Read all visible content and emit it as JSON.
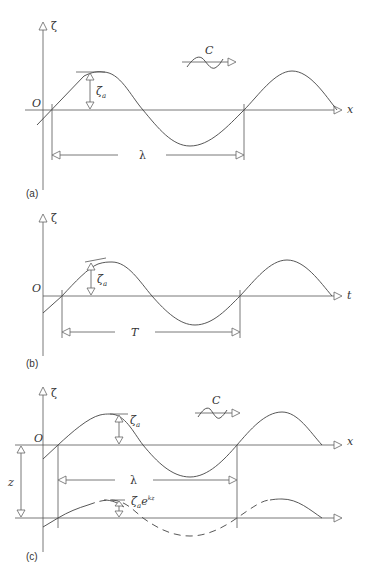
{
  "figure": {
    "panel_a": {
      "tag": "(a)",
      "vertical_axis_label": "ζ",
      "horizontal_axis_label": "x",
      "origin_label": "O",
      "amplitude_label": "ζ",
      "amplitude_subscript": "a",
      "wavelength_label": "λ",
      "celerity_label": "C"
    },
    "panel_b": {
      "tag": "(b)",
      "vertical_axis_label": "ζ",
      "horizontal_axis_label": "t",
      "origin_label": "O",
      "amplitude_label": "ζ",
      "amplitude_subscript": "a",
      "period_label": "T"
    },
    "panel_c": {
      "tag": "(c)",
      "vertical_axis_label": "ζ",
      "horizontal_axis_label": "x",
      "origin_label": "O",
      "amplitude_label": "ζ",
      "amplitude_subscript": "a",
      "wavelength_label": "λ",
      "celerity_label": "C",
      "depth_label": "z",
      "deep_amplitude_base": "ζ",
      "deep_amplitude_subscript": "a",
      "deep_amplitude_e": "e",
      "deep_amplitude_exponent": "kz"
    }
  }
}
